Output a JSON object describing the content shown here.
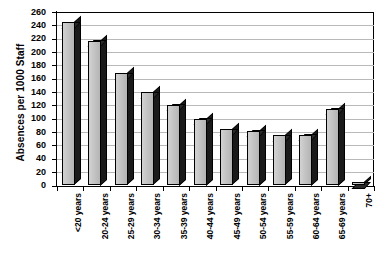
{
  "chart_data": {
    "type": "bar",
    "title": "",
    "xlabel": "",
    "ylabel": "Absences per 1000 Staff",
    "ylim": [
      0,
      260
    ],
    "ytick_step": 20,
    "yticks": [
      0,
      20,
      40,
      60,
      80,
      100,
      120,
      140,
      160,
      180,
      200,
      220,
      240,
      260
    ],
    "grid": "horizontal",
    "legend": "none",
    "style": "3d-column",
    "categories": [
      "<20 years",
      "20-24 years",
      "25-29 years",
      "30-34 years",
      "35-39 years",
      "40-44 years",
      "45-49 years",
      "50-54 years",
      "55-59 years",
      "60-64 years",
      "65-69 years",
      "70+"
    ],
    "values": [
      245,
      217,
      168,
      140,
      121,
      100,
      84,
      82,
      75,
      76,
      115,
      5
    ],
    "series": [
      {
        "name": "Absences per 1000 Staff",
        "values": [
          245,
          217,
          168,
          140,
          121,
          100,
          84,
          82,
          75,
          76,
          115,
          5
        ]
      }
    ],
    "colors": {
      "bar_front": "#c4c4c4",
      "bar_side": "#1a1a1a",
      "bar_outline": "#000000",
      "gridline": "#b9b9b9",
      "axis": "#000000",
      "background": "#ffffff",
      "text": "#000000"
    }
  }
}
